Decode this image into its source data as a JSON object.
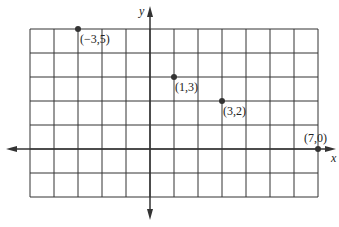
{
  "diagram": {
    "type": "coordinate-grid",
    "axes": {
      "x_label": "x",
      "y_label": "y"
    },
    "grid": {
      "x_min": -5,
      "x_max": 7,
      "y_min": -2,
      "y_max": 5
    },
    "points": [
      {
        "label": "(−3,5)",
        "x": -3,
        "y": 5
      },
      {
        "label": "(1,3)",
        "x": 1,
        "y": 3
      },
      {
        "label": "(3,2)",
        "x": 3,
        "y": 2
      },
      {
        "label": "(7,0)",
        "x": 7,
        "y": 0
      }
    ],
    "colors": {
      "line": "#333333",
      "point": "#333333",
      "background": "#ffffff"
    }
  }
}
